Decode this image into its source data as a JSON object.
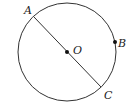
{
  "diagram": {
    "type": "circle-geometry",
    "circle": {
      "center_label": "O",
      "cx": 67,
      "cy": 52,
      "r": 49
    },
    "points": [
      {
        "label": "A",
        "x": 34,
        "y": 17,
        "lx": 24,
        "ly": 14
      },
      {
        "label": "B",
        "x": 115,
        "y": 42,
        "lx": 118,
        "ly": 47
      },
      {
        "label": "C",
        "x": 101,
        "y": 87,
        "lx": 104,
        "ly": 99
      },
      {
        "label": "O",
        "x": 67,
        "y": 52,
        "lx": 73,
        "ly": 54
      }
    ],
    "segments": [
      {
        "from": "A",
        "to": "C",
        "label": "diameter AC"
      }
    ],
    "colors": {
      "stroke": "#333333",
      "background": "#ffffff"
    }
  }
}
